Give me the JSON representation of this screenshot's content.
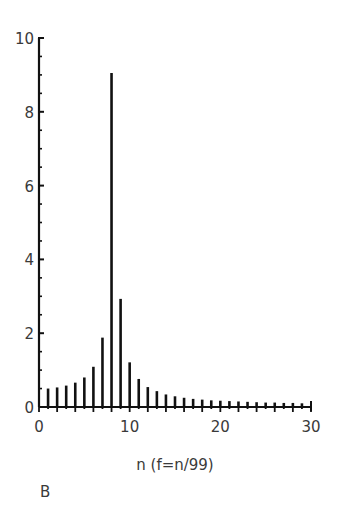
{
  "panel_label": "B",
  "chart_data": {
    "type": "bar",
    "title": "",
    "xlabel": "n (f=n/99)",
    "ylabel": "",
    "xlim": [
      0,
      30
    ],
    "ylim": [
      0,
      10
    ],
    "x_ticks": [
      0,
      10,
      20,
      30
    ],
    "x_tick_labels": [
      "0",
      "10",
      "20",
      "30"
    ],
    "y_ticks": [
      0,
      2,
      4,
      6,
      8,
      10
    ],
    "y_tick_labels": [
      "0",
      "2",
      "4",
      "6",
      "8",
      "10"
    ],
    "y_minor_tick_step": 0.5,
    "x_minor_tick_step": 1,
    "grid": false,
    "legend": null,
    "x": [
      1,
      2,
      3,
      4,
      5,
      6,
      7,
      8,
      9,
      10,
      11,
      12,
      13,
      14,
      15,
      16,
      17,
      18,
      19,
      20,
      21,
      22,
      23,
      24,
      25,
      26,
      27,
      28,
      29
    ],
    "values": [
      0.5,
      0.53,
      0.58,
      0.66,
      0.8,
      1.09,
      1.88,
      9.05,
      2.93,
      1.21,
      0.76,
      0.54,
      0.43,
      0.34,
      0.29,
      0.25,
      0.22,
      0.2,
      0.18,
      0.17,
      0.16,
      0.15,
      0.14,
      0.13,
      0.12,
      0.12,
      0.11,
      0.11,
      0.1
    ],
    "bar_style": "thin vertical lines (stem plot)",
    "colors": {
      "bars": "#111111",
      "axes": "#111111",
      "text": "#3a3a3a"
    }
  },
  "layout": {
    "plot_left_px": 39,
    "plot_right_px": 311,
    "plot_top_px": 38,
    "plot_bottom_px": 407
  }
}
